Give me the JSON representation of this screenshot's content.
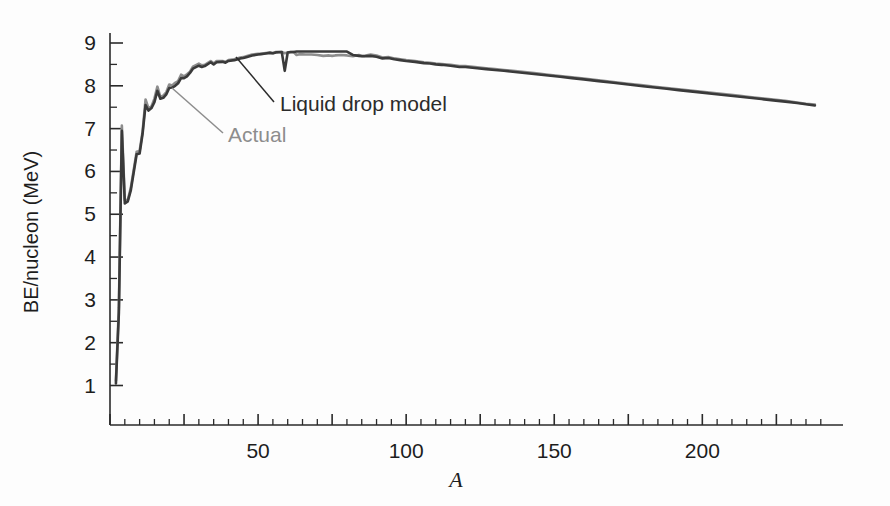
{
  "chart_data": {
    "type": "line",
    "title": "",
    "xlabel": "A",
    "ylabel": "BE/nucleon (MeV)",
    "xlim": [
      0,
      245
    ],
    "ylim": [
      0,
      9.6
    ],
    "grid": false,
    "legend_position": "inline-annotations",
    "x_tick_labels": [
      "50",
      "100",
      "150",
      "200"
    ],
    "x_tick_values": [
      50,
      100,
      150,
      200
    ],
    "x_minor_tick_step": 5,
    "x_major_tick_step": 25,
    "y_tick_labels": [
      "1",
      "2",
      "3",
      "4",
      "5",
      "6",
      "7",
      "8",
      "9"
    ],
    "y_tick_values": [
      1,
      2,
      3,
      4,
      5,
      6,
      7,
      8,
      9
    ],
    "series": [
      {
        "name": "Actual",
        "color": "#8d8d8d",
        "width": 2.6,
        "x": [
          2,
          3,
          4,
          5,
          6,
          7,
          9,
          10,
          11,
          12,
          13,
          14,
          15,
          16,
          17,
          18,
          19,
          20,
          21,
          22,
          23,
          24,
          25,
          26,
          27,
          28,
          30,
          31,
          32,
          34,
          35,
          36,
          38,
          39,
          40,
          42,
          44,
          45,
          46,
          48,
          50,
          51,
          52,
          54,
          55,
          56,
          58,
          59,
          60,
          62,
          63,
          64,
          66,
          68,
          70,
          72,
          74,
          75,
          76,
          78,
          80,
          82,
          84,
          85,
          86,
          88,
          90,
          92,
          94,
          96,
          98,
          100,
          103,
          106,
          108,
          110,
          112,
          115,
          118,
          120,
          124,
          127,
          130,
          133,
          136,
          140,
          144,
          148,
          152,
          156,
          160,
          165,
          170,
          175,
          180,
          184,
          188,
          192,
          196,
          200,
          204,
          208,
          212,
          216,
          220,
          224,
          228,
          232,
          235,
          238
        ],
        "y": [
          1.11,
          2.83,
          7.07,
          5.33,
          5.33,
          5.61,
          6.46,
          6.48,
          6.93,
          7.68,
          7.47,
          7.52,
          7.7,
          7.98,
          7.74,
          7.77,
          7.85,
          8.03,
          8.01,
          8.07,
          8.11,
          8.26,
          8.22,
          8.27,
          8.33,
          8.45,
          8.52,
          8.48,
          8.49,
          8.58,
          8.52,
          8.58,
          8.58,
          8.56,
          8.6,
          8.62,
          8.66,
          8.67,
          8.69,
          8.73,
          8.75,
          8.75,
          8.76,
          8.78,
          8.76,
          8.79,
          8.79,
          8.76,
          8.78,
          8.79,
          8.72,
          8.74,
          8.73,
          8.73,
          8.72,
          8.7,
          8.71,
          8.7,
          8.71,
          8.72,
          8.71,
          8.69,
          8.72,
          8.7,
          8.7,
          8.73,
          8.71,
          8.66,
          8.67,
          8.64,
          8.62,
          8.6,
          8.58,
          8.55,
          8.54,
          8.52,
          8.51,
          8.49,
          8.46,
          8.46,
          8.43,
          8.41,
          8.39,
          8.37,
          8.35,
          8.32,
          8.29,
          8.26,
          8.23,
          8.2,
          8.17,
          8.13,
          8.09,
          8.05,
          8.01,
          7.98,
          7.95,
          7.92,
          7.89,
          7.86,
          7.83,
          7.8,
          7.77,
          7.74,
          7.71,
          7.68,
          7.65,
          7.61,
          7.58,
          7.56
        ]
      },
      {
        "name": "Liquid drop model",
        "color": "#3a3a3a",
        "width": 2.6,
        "x": [
          2,
          3,
          4,
          5,
          6,
          7,
          9,
          10,
          11,
          12,
          13,
          14,
          15,
          16,
          17,
          18,
          19,
          20,
          21,
          22,
          23,
          24,
          25,
          26,
          27,
          28,
          30,
          31,
          32,
          34,
          35,
          36,
          38,
          39,
          40,
          42,
          44,
          45,
          46,
          48,
          50,
          51,
          52,
          54,
          55,
          56,
          58,
          59,
          60,
          61,
          62,
          63,
          64,
          66,
          68,
          70,
          72,
          74,
          75,
          76,
          78,
          80,
          82,
          84,
          85,
          86,
          88,
          90,
          92,
          94,
          96,
          98,
          100,
          103,
          106,
          108,
          110,
          112,
          115,
          118,
          120,
          124,
          127,
          130,
          133,
          136,
          140,
          144,
          148,
          152,
          156,
          160,
          165,
          170,
          175,
          180,
          184,
          188,
          192,
          196,
          200,
          204,
          208,
          212,
          216,
          220,
          224,
          228,
          232,
          235,
          238
        ],
        "y": [
          1.05,
          2.7,
          6.95,
          5.25,
          5.3,
          5.55,
          6.4,
          6.42,
          6.88,
          7.55,
          7.42,
          7.48,
          7.62,
          7.88,
          7.7,
          7.72,
          7.8,
          7.95,
          7.96,
          8.0,
          8.06,
          8.18,
          8.18,
          8.22,
          8.3,
          8.4,
          8.47,
          8.44,
          8.46,
          8.55,
          8.5,
          8.55,
          8.56,
          8.54,
          8.58,
          8.6,
          8.64,
          8.65,
          8.67,
          8.71,
          8.73,
          8.74,
          8.75,
          8.77,
          8.76,
          8.78,
          8.79,
          8.35,
          8.78,
          8.79,
          8.79,
          8.8,
          8.8,
          8.8,
          8.8,
          8.8,
          8.8,
          8.8,
          8.8,
          8.8,
          8.8,
          8.8,
          8.72,
          8.7,
          8.69,
          8.69,
          8.7,
          8.68,
          8.64,
          8.65,
          8.62,
          8.6,
          8.58,
          8.56,
          8.53,
          8.52,
          8.5,
          8.49,
          8.47,
          8.44,
          8.44,
          8.41,
          8.39,
          8.37,
          8.35,
          8.33,
          8.3,
          8.27,
          8.24,
          8.21,
          8.18,
          8.15,
          8.11,
          8.07,
          8.03,
          7.99,
          7.96,
          7.93,
          7.9,
          7.87,
          7.84,
          7.81,
          7.78,
          7.75,
          7.72,
          7.69,
          7.66,
          7.63,
          7.6,
          7.57,
          7.54
        ]
      }
    ],
    "annotations": [
      {
        "text": "Liquid drop model",
        "color": "#2b2b2b",
        "label_x": 280,
        "label_y": 111,
        "leader_from_x": 274,
        "leader_from_y": 102,
        "leader_to_x": 236,
        "leader_to_y": 57
      },
      {
        "text": "Actual",
        "color": "#8d8d8d",
        "label_x": 228,
        "label_y": 142,
        "leader_from_x": 223,
        "leader_from_y": 133,
        "leader_to_x": 172,
        "leader_to_y": 88
      }
    ]
  },
  "axes": {
    "y_title": "BE/nucleon (MeV)",
    "x_title": "A"
  }
}
